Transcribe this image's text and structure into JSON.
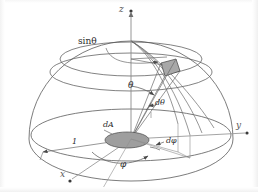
{
  "figure": {
    "background_color": "#ffffff",
    "line_color": "#4a4a4a",
    "label_color": "#2b2b2b",
    "patch_fill": "#a8a8a8",
    "disc_fill": "#9e9e9e"
  },
  "axes": {
    "z_label": "z",
    "y_label": "y",
    "x_label": "x"
  },
  "labels": {
    "sin_theta": "sinθ",
    "theta": "θ",
    "d_theta": "dθ",
    "phi": "φ",
    "d_phi": "dφ",
    "dA": "dA",
    "radius": "1"
  },
  "geometry": {
    "origin": {
      "x": 131,
      "y": 139
    },
    "sphere_radius_x": 102,
    "sphere_radius_y": 98,
    "base_ellipse_ry": 26,
    "theta_value_deg": 35,
    "phi_value_deg": 55,
    "unit_radius": 1
  }
}
